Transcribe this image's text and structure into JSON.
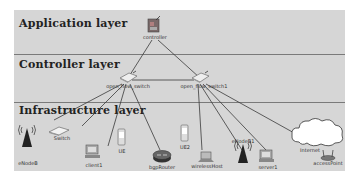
{
  "layers": [
    {
      "title": "Application layer"
    },
    {
      "title": "Controller layer"
    },
    {
      "title": "Infrastructure layer"
    }
  ],
  "nodes": {
    "controller": {
      "label": "controller"
    },
    "switch1": {
      "label": "open_flow_switch"
    },
    "switch2": {
      "label": "open_flow_switch1"
    },
    "enodeb": {
      "label": "eNodeB"
    },
    "switch": {
      "label": "Switch"
    },
    "client1": {
      "label": "client1"
    },
    "ue": {
      "label": "UE"
    },
    "bgprouter": {
      "label": "bgpRouter"
    },
    "ue2": {
      "label": "UE2"
    },
    "wirelesshost": {
      "label": "wirelessHost"
    },
    "enodeb1": {
      "label": "eNodeB1"
    },
    "server1": {
      "label": "server1"
    },
    "internet": {
      "label": "Internet"
    },
    "accesspoint": {
      "label": "accessPoint"
    }
  },
  "colors": {
    "background": "#d6d6d6",
    "divider": "#7a7a7a",
    "link": "#3a3a3a"
  }
}
